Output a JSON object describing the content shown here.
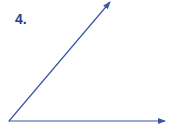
{
  "problem": {
    "number_label": "4."
  },
  "diagram": {
    "type": "angle",
    "stroke_color": "#3b55a6",
    "vertex": [
      9,
      121
    ],
    "rays": [
      {
        "name": "horizontal-ray",
        "end": [
          165,
          121
        ]
      },
      {
        "name": "diagonal-ray",
        "end": [
          110,
          2
        ]
      }
    ]
  }
}
